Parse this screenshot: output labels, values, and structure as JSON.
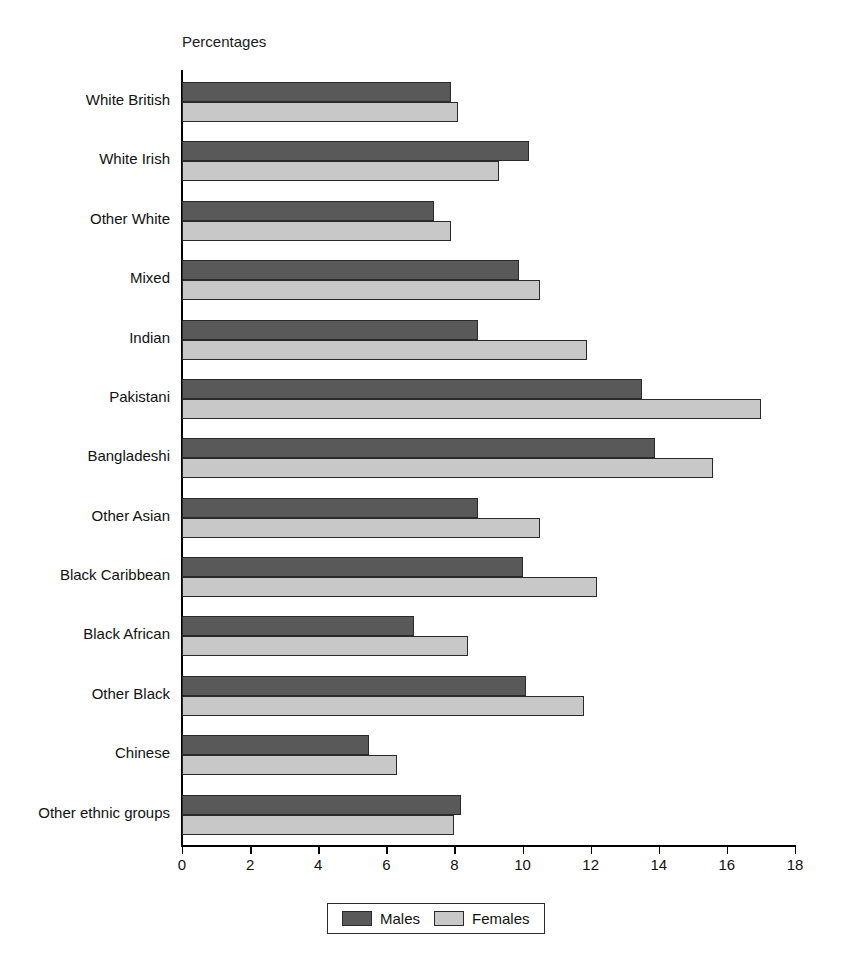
{
  "chart_data": {
    "type": "bar",
    "orientation": "horizontal",
    "title": "",
    "axis_title": "Percentages",
    "xlabel": "Percentages",
    "ylabel": "",
    "xlim": [
      0,
      18
    ],
    "xticks": [
      0,
      2,
      4,
      6,
      8,
      10,
      12,
      14,
      16,
      18
    ],
    "grid": false,
    "legend_position": "bottom",
    "categories": [
      "White British",
      "White Irish",
      "Other White",
      "Mixed",
      "Indian",
      "Pakistani",
      "Bangladeshi",
      "Other Asian",
      "Black Caribbean",
      "Black African",
      "Other Black",
      "Chinese",
      "Other ethnic groups"
    ],
    "series": [
      {
        "name": "Males",
        "color": "#595959",
        "values": [
          7.9,
          10.2,
          7.4,
          9.9,
          8.7,
          13.5,
          13.9,
          8.7,
          10.0,
          6.8,
          10.1,
          5.5,
          8.2
        ]
      },
      {
        "name": "Females",
        "color": "#c8c8c8",
        "values": [
          8.1,
          9.3,
          7.9,
          10.5,
          11.9,
          17.0,
          15.6,
          10.5,
          12.2,
          8.4,
          11.8,
          6.3,
          8.0
        ]
      }
    ]
  }
}
